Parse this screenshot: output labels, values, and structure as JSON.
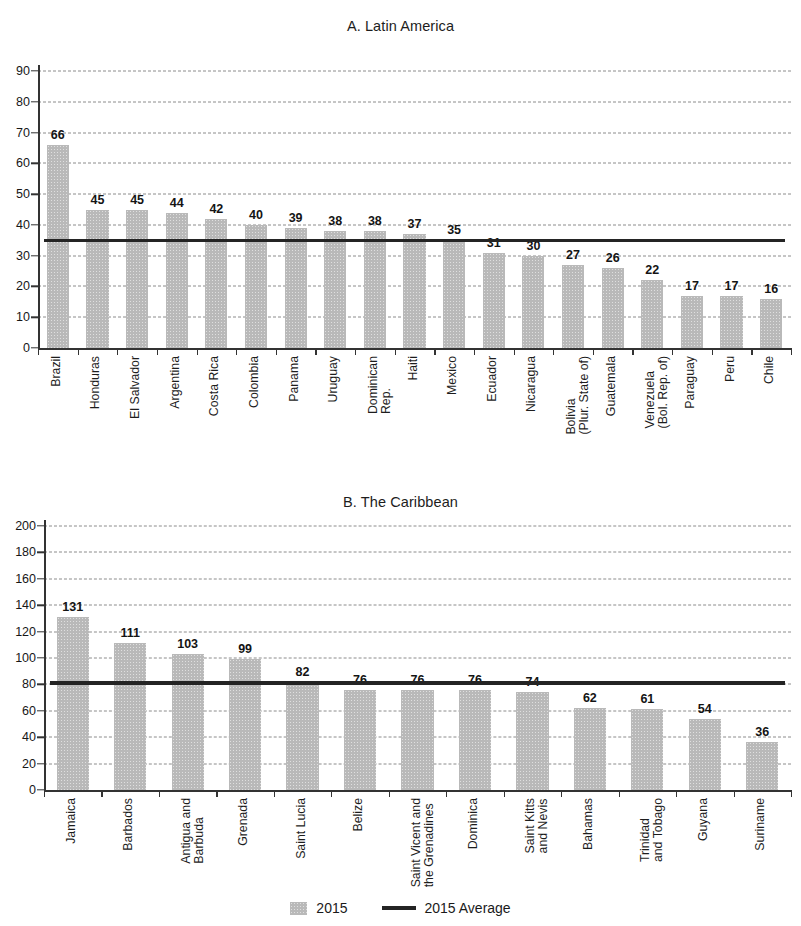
{
  "legend": {
    "bar_label": "2015",
    "line_label": "2015 Average"
  },
  "chart_data": [
    {
      "type": "bar",
      "panel": "A",
      "title": "A. Latin America",
      "xlabel": "",
      "ylabel": "",
      "ylim": [
        0,
        90
      ],
      "yticks": [
        0,
        10,
        20,
        30,
        40,
        50,
        60,
        70,
        80,
        90
      ],
      "grid": true,
      "legend_position": "bottom",
      "categories": [
        "Brazil",
        "Honduras",
        "El Salvador",
        "Argentina",
        "Costa Rica",
        "Colombia",
        "Panama",
        "Uruguay",
        "Dominican\nRep.",
        "Haiti",
        "Mexico",
        "Ecuador",
        "Nicaragua",
        "Bolivia\n(Plur. State of)",
        "Guatemala",
        "Venezuela\n(Bol. Rep. of)",
        "Paraguay",
        "Peru",
        "Chile"
      ],
      "series": [
        {
          "name": "2015",
          "values": [
            66,
            45,
            45,
            44,
            42,
            40,
            39,
            38,
            38,
            37,
            35,
            31,
            30,
            27,
            26,
            22,
            17,
            17,
            16
          ]
        }
      ],
      "average_line": {
        "name": "2015 Average",
        "value": 35
      }
    },
    {
      "type": "bar",
      "panel": "B",
      "title": "B. The Caribbean",
      "xlabel": "",
      "ylabel": "",
      "ylim": [
        0,
        200
      ],
      "yticks": [
        0,
        20,
        40,
        60,
        80,
        100,
        120,
        140,
        160,
        180,
        200
      ],
      "grid": true,
      "legend_position": "bottom",
      "categories": [
        "Jamaica",
        "Barbados",
        "Antigua and\nBarbuda",
        "Grenada",
        "Saint Lucia",
        "Belize",
        "Saint Vicent and\nthe Grenadines",
        "Dominica",
        "Saint Kitts\nand Nevis",
        "Bahamas",
        "Trinidad\nand Tobago",
        "Guyana",
        "Suriname"
      ],
      "series": [
        {
          "name": "2015",
          "values": [
            131,
            111,
            103,
            99,
            82,
            76,
            76,
            76,
            74,
            62,
            61,
            54,
            36
          ]
        }
      ],
      "average_line": {
        "name": "2015 Average",
        "value": 81
      }
    }
  ]
}
